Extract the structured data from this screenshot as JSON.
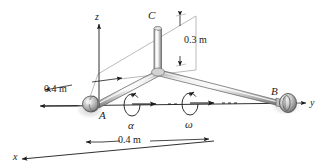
{
  "figure": {
    "type": "engineering-mechanics-diagram",
    "colors": {
      "line": "#1a1a1a",
      "construction": "#9a9a9a",
      "rod_light": "#f2f2f2",
      "rod_mid": "#c9c9c9",
      "rod_dark": "#8f8f8f",
      "shadow": "#d9d9d9",
      "background": "#ffffff"
    }
  },
  "axes": {
    "x": "x",
    "y": "y",
    "z": "z"
  },
  "points": {
    "a": "A",
    "b": "B",
    "c": "C"
  },
  "dimensions": [
    {
      "id": "vertical-arm",
      "label": "0.3 m"
    },
    {
      "id": "offset-left",
      "label": "0.4 m"
    },
    {
      "id": "span-bottom",
      "label": "0.4 m"
    }
  ],
  "kinematics": [
    {
      "id": "angular-acceleration",
      "symbol": "α"
    },
    {
      "id": "angular-velocity",
      "symbol": "ω"
    }
  ]
}
